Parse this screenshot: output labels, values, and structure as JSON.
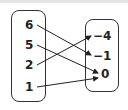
{
  "diagram": {
    "type": "mapping",
    "domain": [
      "6",
      "5",
      "2",
      "1"
    ],
    "range": [
      "−4",
      "−1",
      "0"
    ],
    "mappings": [
      {
        "from": "6",
        "to": "−1"
      },
      {
        "from": "5",
        "to": "0"
      },
      {
        "from": "2",
        "to": "−4"
      },
      {
        "from": "1",
        "to": "0"
      }
    ]
  }
}
